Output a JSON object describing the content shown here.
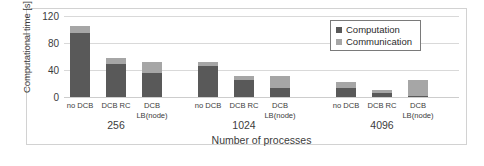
{
  "chart_data": {
    "type": "bar",
    "title": "",
    "subtitle": "",
    "xlabel": "Number of processes",
    "ylabel": "Computational time [s]",
    "ylabel_lines": [
      "Computational",
      "time [s]"
    ],
    "stacked": true,
    "grid": true,
    "ylim": [
      0,
      120
    ],
    "yticks": [
      0,
      40,
      80,
      120
    ],
    "ytick_labels": [
      "0",
      "40",
      "80",
      "120"
    ],
    "legend_position": "top-right",
    "colors": {
      "computation": "#595959",
      "communication": "#a6a6a6",
      "gridline": "#d9d9d9",
      "frame": "#d2d2d2",
      "text": "#3c3c3c"
    },
    "series": [
      {
        "name": "Computation",
        "color": "#595959",
        "values": [
          95,
          49,
          36,
          46,
          25,
          13,
          13,
          6,
          1
        ]
      },
      {
        "name": "Communication",
        "color": "#a6a6a6",
        "values": [
          10,
          9,
          16,
          6,
          6,
          18,
          9,
          5,
          24
        ]
      }
    ],
    "categories": [
      "no DCB",
      "DCB RC",
      "DCB LB(node)",
      "no DCB",
      "DCB RC",
      "DCB LB(node)",
      "no DCB",
      "DCB RC",
      "DCB LB(node)"
    ],
    "groups": [
      {
        "label": "256",
        "bars": [
          {
            "tick_line1": "no DCB",
            "tick_line2": "",
            "computation": 95,
            "communication": 10,
            "total": 105
          },
          {
            "tick_line1": "DCB RC",
            "tick_line2": "",
            "computation": 49,
            "communication": 9,
            "total": 58
          },
          {
            "tick_line1": "DCB",
            "tick_line2": "LB(node)",
            "computation": 36,
            "communication": 16,
            "total": 52
          }
        ]
      },
      {
        "label": "1024",
        "bars": [
          {
            "tick_line1": "no DCB",
            "tick_line2": "",
            "computation": 46,
            "communication": 6,
            "total": 52
          },
          {
            "tick_line1": "DCB RC",
            "tick_line2": "",
            "computation": 25,
            "communication": 6,
            "total": 31
          },
          {
            "tick_line1": "DCB",
            "tick_line2": "LB(node)",
            "computation": 13,
            "communication": 18,
            "total": 31
          }
        ]
      },
      {
        "label": "4096",
        "bars": [
          {
            "tick_line1": "no DCB",
            "tick_line2": "",
            "computation": 13,
            "communication": 9,
            "total": 22
          },
          {
            "tick_line1": "DCB RC",
            "tick_line2": "",
            "computation": 6,
            "communication": 5,
            "total": 11
          },
          {
            "tick_line1": "DCB",
            "tick_line2": "LB(node)",
            "computation": 1,
            "communication": 24,
            "total": 25
          }
        ]
      }
    ],
    "legend": [
      {
        "label": "Computation",
        "color": "#595959"
      },
      {
        "label": "Communication",
        "color": "#a6a6a6"
      }
    ]
  }
}
